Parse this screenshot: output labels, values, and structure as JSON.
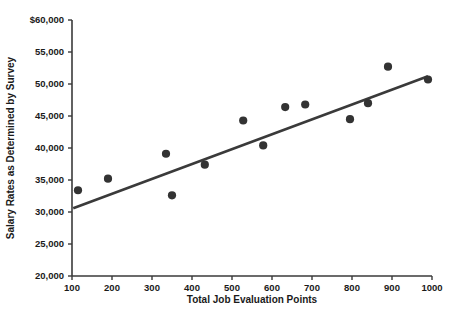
{
  "chart_data": {
    "type": "scatter",
    "title": "",
    "xlabel": "Total Job Evaluation Points",
    "ylabel": "Salary Rates as Determined by Survey",
    "xlim": [
      100,
      1000
    ],
    "ylim": [
      20000,
      60000
    ],
    "grid": false,
    "legend": "none",
    "xticks": [
      100,
      200,
      300,
      400,
      500,
      600,
      700,
      800,
      900,
      1000
    ],
    "xtick_labels": [
      "100",
      "200",
      "300",
      "400",
      "500",
      "600",
      "700",
      "800",
      "900",
      "1000"
    ],
    "yticks": [
      20000,
      25000,
      30000,
      35000,
      40000,
      45000,
      50000,
      55000,
      60000
    ],
    "ytick_labels": [
      "20,000",
      "25,000",
      "30,000",
      "35,000",
      "40,000",
      "45,000",
      "50,000",
      "55,000",
      "$60,000"
    ],
    "series": [
      {
        "name": "Salary survey observations",
        "marker": "filled-circle",
        "color": "#333333",
        "points": [
          {
            "x": 115,
            "y": 33400
          },
          {
            "x": 190,
            "y": 35200
          },
          {
            "x": 335,
            "y": 39100
          },
          {
            "x": 350,
            "y": 32600
          },
          {
            "x": 432,
            "y": 37400
          },
          {
            "x": 528,
            "y": 44300
          },
          {
            "x": 578,
            "y": 40400
          },
          {
            "x": 633,
            "y": 46400
          },
          {
            "x": 683,
            "y": 46800
          },
          {
            "x": 795,
            "y": 44500
          },
          {
            "x": 840,
            "y": 47000
          },
          {
            "x": 890,
            "y": 52700
          },
          {
            "x": 990,
            "y": 50700
          }
        ]
      }
    ],
    "trend_line": {
      "name": "Least squares trend line",
      "color": "#3a3a3a",
      "start": {
        "x": 103,
        "y": 30600
      },
      "end": {
        "x": 990,
        "y": 51200
      }
    }
  },
  "colors": {
    "background": "#ffffff",
    "axis": "#3a3a3a",
    "marker": "#333333",
    "text": "#1a1a1a"
  }
}
